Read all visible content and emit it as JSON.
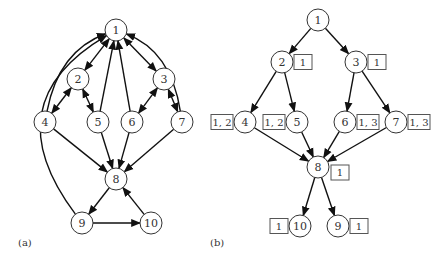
{
  "panel_a": {
    "caption": "(a)",
    "nodes": [
      {
        "id": "1",
        "x": 116,
        "y": 30
      },
      {
        "id": "2",
        "x": 78,
        "y": 79
      },
      {
        "id": "3",
        "x": 164,
        "y": 79
      },
      {
        "id": "4",
        "x": 45,
        "y": 122
      },
      {
        "id": "5",
        "x": 98,
        "y": 122
      },
      {
        "id": "6",
        "x": 132,
        "y": 122
      },
      {
        "id": "7",
        "x": 182,
        "y": 122
      },
      {
        "id": "8",
        "x": 116,
        "y": 179
      },
      {
        "id": "9",
        "x": 82,
        "y": 223
      },
      {
        "id": "10",
        "x": 151,
        "y": 223
      }
    ],
    "edges": [
      {
        "from": "1",
        "to": "2",
        "bidirectional": true
      },
      {
        "from": "1",
        "to": "3",
        "bidirectional": true
      },
      {
        "from": "2",
        "to": "4",
        "bidirectional": true
      },
      {
        "from": "2",
        "to": "5",
        "bidirectional": true
      },
      {
        "from": "3",
        "to": "6",
        "bidirectional": true
      },
      {
        "from": "3",
        "to": "7",
        "bidirectional": true
      },
      {
        "from": "4",
        "to": "1",
        "curved": true
      },
      {
        "from": "5",
        "to": "1"
      },
      {
        "from": "6",
        "to": "1"
      },
      {
        "from": "7",
        "to": "1",
        "curved": true
      },
      {
        "from": "9",
        "to": "1",
        "curved": true
      },
      {
        "from": "4",
        "to": "8"
      },
      {
        "from": "5",
        "to": "8"
      },
      {
        "from": "6",
        "to": "8"
      },
      {
        "from": "7",
        "to": "8"
      },
      {
        "from": "8",
        "to": "9"
      },
      {
        "from": "9",
        "to": "10"
      },
      {
        "from": "10",
        "to": "8"
      }
    ]
  },
  "panel_b": {
    "caption": "(b)",
    "nodes": [
      {
        "id": "1",
        "x": 318,
        "y": 20,
        "label": null
      },
      {
        "id": "2",
        "x": 282,
        "y": 62,
        "label": "1",
        "label_side": "right"
      },
      {
        "id": "3",
        "x": 356,
        "y": 62,
        "label": "1",
        "label_side": "right"
      },
      {
        "id": "4",
        "x": 245,
        "y": 122,
        "label": "1, 2",
        "label_side": "left"
      },
      {
        "id": "5",
        "x": 297,
        "y": 122,
        "label": "1, 2",
        "label_side": "left"
      },
      {
        "id": "6",
        "x": 345,
        "y": 122,
        "label": "1, 3",
        "label_side": "right"
      },
      {
        "id": "7",
        "x": 396,
        "y": 122,
        "label": "1, 3",
        "label_side": "right"
      },
      {
        "id": "8",
        "x": 318,
        "y": 167,
        "label": "1",
        "label_side": "right-low"
      },
      {
        "id": "10",
        "x": 300,
        "y": 226,
        "label": "1",
        "label_side": "left"
      },
      {
        "id": "9",
        "x": 338,
        "y": 226,
        "label": "1",
        "label_side": "right"
      }
    ],
    "edges": [
      {
        "from": "1",
        "to": "2"
      },
      {
        "from": "1",
        "to": "3"
      },
      {
        "from": "2",
        "to": "4"
      },
      {
        "from": "2",
        "to": "5"
      },
      {
        "from": "3",
        "to": "6"
      },
      {
        "from": "3",
        "to": "7"
      },
      {
        "from": "4",
        "to": "8"
      },
      {
        "from": "5",
        "to": "8"
      },
      {
        "from": "6",
        "to": "8"
      },
      {
        "from": "7",
        "to": "8"
      },
      {
        "from": "8",
        "to": "10"
      },
      {
        "from": "8",
        "to": "9"
      }
    ]
  }
}
